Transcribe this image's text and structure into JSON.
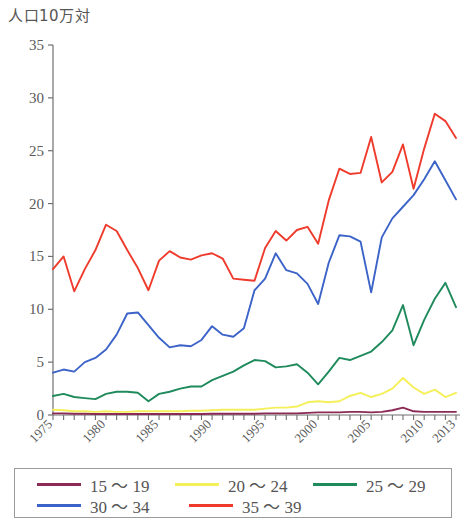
{
  "chart_data": {
    "type": "line",
    "title": "人口10万対",
    "xlabel": "",
    "ylabel": "人口10万対",
    "ylim": [
      0,
      35
    ],
    "yticks": [
      0,
      5,
      10,
      15,
      20,
      25,
      30,
      35
    ],
    "xlim": [
      1975,
      2013
    ],
    "xticks_labeled": [
      "1975",
      "1980",
      "1985",
      "1990",
      "1995",
      "2000",
      "2005",
      "2010",
      "2013"
    ],
    "xticks_labeled_values": [
      1975,
      1980,
      1985,
      1990,
      1995,
      2000,
      2005,
      2010,
      2013
    ],
    "grid": false,
    "legend_position": "bottom",
    "x": [
      1975,
      1976,
      1977,
      1978,
      1979,
      1980,
      1981,
      1982,
      1983,
      1984,
      1985,
      1986,
      1987,
      1988,
      1989,
      1990,
      1991,
      1992,
      1993,
      1994,
      1995,
      1996,
      1997,
      1998,
      1999,
      2000,
      2001,
      2002,
      2003,
      2004,
      2005,
      2006,
      2007,
      2008,
      2009,
      2010,
      2011,
      2012,
      2013
    ],
    "series": [
      {
        "name": "15 ～ 19",
        "color": "#8b2a55",
        "values": [
          0.15,
          0.15,
          0.12,
          0.12,
          0.1,
          0.1,
          0.1,
          0.1,
          0.1,
          0.1,
          0.1,
          0.1,
          0.1,
          0.1,
          0.1,
          0.12,
          0.12,
          0.12,
          0.12,
          0.12,
          0.15,
          0.15,
          0.15,
          0.15,
          0.2,
          0.25,
          0.25,
          0.25,
          0.3,
          0.3,
          0.25,
          0.3,
          0.45,
          0.7,
          0.35,
          0.3,
          0.3,
          0.3,
          0.3
        ]
      },
      {
        "name": "20 ～ 24",
        "color": "#f5ef5a",
        "values": [
          0.5,
          0.45,
          0.35,
          0.35,
          0.3,
          0.35,
          0.3,
          0.3,
          0.35,
          0.35,
          0.35,
          0.35,
          0.35,
          0.4,
          0.4,
          0.45,
          0.5,
          0.5,
          0.5,
          0.5,
          0.6,
          0.7,
          0.7,
          0.8,
          1.2,
          1.3,
          1.2,
          1.3,
          1.8,
          2.1,
          1.7,
          2.0,
          2.5,
          3.5,
          2.6,
          2.0,
          2.4,
          1.7,
          2.1
        ]
      },
      {
        "name": "25 ～ 29",
        "color": "#1f8a5c",
        "values": [
          1.8,
          2.0,
          1.7,
          1.6,
          1.5,
          2.0,
          2.2,
          2.2,
          2.1,
          1.3,
          2.0,
          2.2,
          2.5,
          2.7,
          2.7,
          3.3,
          3.7,
          4.1,
          4.7,
          5.2,
          5.1,
          4.5,
          4.6,
          4.8,
          4.0,
          2.9,
          4.1,
          5.4,
          5.2,
          5.6,
          6.0,
          6.9,
          8.0,
          10.4,
          6.6,
          9.0,
          11.0,
          12.5,
          10.2
        ]
      },
      {
        "name": "30 ～ 34",
        "color": "#3c63c8",
        "values": [
          4.0,
          4.3,
          4.1,
          5.0,
          5.4,
          6.2,
          7.6,
          9.6,
          9.7,
          8.5,
          7.3,
          6.4,
          6.6,
          6.5,
          7.1,
          8.4,
          7.6,
          7.4,
          8.2,
          11.8,
          12.9,
          15.3,
          13.7,
          13.4,
          12.4,
          10.5,
          14.4,
          17.0,
          16.9,
          16.4,
          11.6,
          16.8,
          18.6,
          19.7,
          20.8,
          22.3,
          24.0,
          22.2,
          20.4
        ]
      },
      {
        "name": "35 ～ 39",
        "color": "#ef3b2c",
        "values": [
          13.8,
          15.0,
          11.7,
          13.8,
          15.6,
          18.0,
          17.4,
          15.6,
          13.9,
          11.8,
          14.6,
          15.5,
          14.9,
          14.7,
          15.1,
          15.3,
          14.8,
          12.9,
          12.8,
          12.7,
          15.8,
          17.4,
          16.5,
          17.5,
          17.8,
          16.2,
          20.3,
          23.3,
          22.8,
          22.9,
          26.3,
          22.0,
          23.0,
          25.6,
          21.4,
          25.2,
          28.5,
          27.8,
          26.2
        ]
      }
    ]
  },
  "legend": {
    "rows": [
      [
        {
          "label": "15 ～ 19",
          "color": "#8b2a55"
        },
        {
          "label": "20 ～ 24",
          "color": "#f5ef5a"
        },
        {
          "label": "25 ～ 29",
          "color": "#1f8a5c"
        }
      ],
      [
        {
          "label": "30 ～ 34",
          "color": "#3c63c8"
        },
        {
          "label": "35 ～ 39",
          "color": "#ef3b2c"
        }
      ]
    ]
  }
}
